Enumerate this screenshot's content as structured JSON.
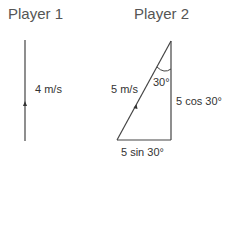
{
  "player1": {
    "title": "Player 1",
    "velocity_label": "4 m/s"
  },
  "player2": {
    "title": "Player 2",
    "hypotenuse_label": "5 m/s",
    "angle_label": "30°",
    "vertical_label": "5 cos 30°",
    "horizontal_label": "5 sin 30°"
  }
}
